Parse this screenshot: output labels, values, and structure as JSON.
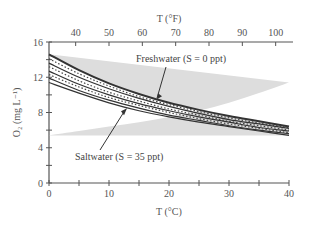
{
  "chart_data": {
    "type": "line",
    "title": "",
    "xlabel": "T (°C)",
    "ylabel": "O₂ (mg L⁻¹)",
    "x2label": "T (°F)",
    "xlim": [
      0,
      40
    ],
    "ylim": [
      0,
      16
    ],
    "x2lim": [
      32,
      104
    ],
    "xticks": [
      0,
      10,
      20,
      30,
      40
    ],
    "xminor": [
      5,
      15,
      25,
      35
    ],
    "yticks": [
      0,
      4,
      8,
      12,
      16
    ],
    "yminor": [
      2,
      6,
      10,
      14
    ],
    "x2ticks": [
      40,
      50,
      60,
      70,
      80,
      90,
      100
    ],
    "grid": false,
    "x": [
      0,
      5,
      10,
      15,
      20,
      25,
      30,
      35,
      40
    ],
    "series": [
      {
        "name": "S = 0 ppt",
        "style": "solid",
        "values": [
          14.6,
          12.8,
          11.3,
          10.1,
          9.1,
          8.3,
          7.6,
          7.0,
          6.4
        ]
      },
      {
        "name": "S = 5 ppt",
        "style": "dotted",
        "values": [
          14.1,
          12.4,
          11.0,
          9.8,
          8.9,
          8.1,
          7.4,
          6.8,
          6.3
        ]
      },
      {
        "name": "S = 10 ppt",
        "style": "solid",
        "values": [
          13.6,
          12.0,
          10.7,
          9.6,
          8.7,
          7.9,
          7.2,
          6.7,
          6.2
        ]
      },
      {
        "name": "S = 15 ppt",
        "style": "dotted",
        "values": [
          13.2,
          11.6,
          10.3,
          9.3,
          8.4,
          7.7,
          7.0,
          6.5,
          6.0
        ]
      },
      {
        "name": "S = 20 ppt",
        "style": "solid",
        "values": [
          12.7,
          11.2,
          10.0,
          9.0,
          8.2,
          7.5,
          6.9,
          6.3,
          5.9
        ]
      },
      {
        "name": "S = 25 ppt",
        "style": "dotted",
        "values": [
          12.3,
          10.9,
          9.7,
          8.8,
          8.0,
          7.3,
          6.7,
          6.2,
          5.7
        ]
      },
      {
        "name": "S = 30 ppt",
        "style": "solid",
        "values": [
          11.9,
          10.5,
          9.4,
          8.5,
          7.7,
          7.1,
          6.5,
          6.0,
          5.6
        ]
      },
      {
        "name": "S = 35 ppt",
        "style": "solid",
        "values": [
          11.4,
          10.2,
          9.1,
          8.2,
          7.5,
          6.9,
          6.4,
          5.9,
          5.4
        ]
      }
    ],
    "annotations": [
      {
        "text": "Freshwater (S = 0 ppt)",
        "points_to": {
          "x": 18,
          "y": 9.4
        }
      },
      {
        "text": "Saltwater (S = 35 ppt)",
        "points_to": {
          "x": 13,
          "y": 8.6
        }
      }
    ]
  }
}
